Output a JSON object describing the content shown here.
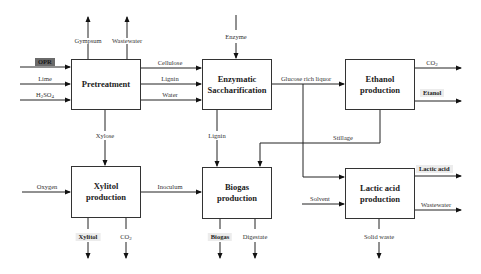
{
  "diagram": {
    "boxes": {
      "pretreatment": {
        "line1": "Pretreatment",
        "line2": ""
      },
      "enzymatic": {
        "line1": "Enzymatic",
        "line2": "Saccharification"
      },
      "ethanol": {
        "line1": "Ethanol",
        "line2": "production"
      },
      "xylitol": {
        "line1": "Xylitol",
        "line2": "production"
      },
      "biogas": {
        "line1": "Biogas",
        "line2": "production"
      },
      "lactic": {
        "line1": "Lactic acid",
        "line2": "production"
      }
    },
    "labels": {
      "opr": "OPR",
      "lime": "Lime",
      "h2so4_main": "H",
      "h2so4_sub1": "2",
      "h2so4_mid": "SO",
      "h2so4_sub2": "4",
      "gympsum": "Gympsum",
      "wastewater_top": "Wastewater",
      "enzyme": "Enzyme",
      "cellulose": "Cellulose",
      "lignin_side": "Lignin",
      "water": "Water",
      "glucose": "Glucose rich liquor",
      "co2_ethanol_main": "CO",
      "co2_ethanol_sub": "2",
      "etanol": "Etanol",
      "stillage": "Stillage",
      "xylose": "Xylose",
      "lignin_down": "Lignin",
      "oxygen": "Oxygen",
      "inoculum": "Inoculum",
      "solvent": "Solvent",
      "lactic_acid": "Lactic acid",
      "wastewater_lactic": "Wastewater",
      "xylitol_out": "Xylitol",
      "co2_xylitol_main": "CO",
      "co2_xylitol_sub": "2",
      "biogas_out": "Biogas",
      "digestate": "Digestate",
      "solid_waste": "Solid waste"
    }
  }
}
